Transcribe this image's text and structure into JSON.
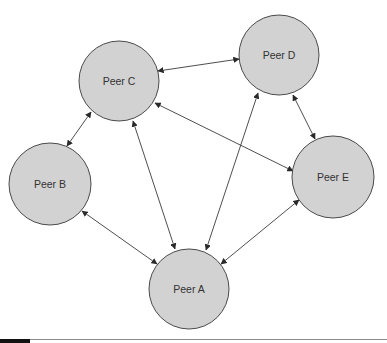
{
  "diagram": {
    "type": "peer-to-peer network",
    "colors": {
      "node_fill": "#d2d2d2",
      "node_stroke": "#4a4a4a",
      "edge": "#3a3a3a",
      "label": "#333333"
    },
    "nodes": [
      {
        "id": "A",
        "label": "Peer A",
        "cx": 189,
        "cy": 289,
        "r": 40
      },
      {
        "id": "B",
        "label": "Peer B",
        "cx": 50,
        "cy": 184,
        "r": 41
      },
      {
        "id": "C",
        "label": "Peer C",
        "cx": 119,
        "cy": 81,
        "r": 40
      },
      {
        "id": "D",
        "label": "Peer D",
        "cx": 279,
        "cy": 55,
        "r": 40
      },
      {
        "id": "E",
        "label": "Peer E",
        "cx": 333,
        "cy": 177,
        "r": 41
      }
    ],
    "edges": [
      {
        "from": "C",
        "to": "D",
        "x1": 158,
        "y1": 71,
        "x2": 239,
        "y2": 59,
        "bidirectional": true
      },
      {
        "from": "C",
        "to": "B",
        "x1": 91,
        "y1": 112,
        "x2": 67,
        "y2": 146,
        "bidirectional": true
      },
      {
        "from": "B",
        "to": "A",
        "x1": 82,
        "y1": 211,
        "x2": 157,
        "y2": 264,
        "bidirectional": true
      },
      {
        "from": "C",
        "to": "A",
        "x1": 133,
        "y1": 121,
        "x2": 175,
        "y2": 249,
        "bidirectional": true
      },
      {
        "from": "D",
        "to": "A",
        "x1": 258,
        "y1": 93,
        "x2": 206,
        "y2": 250,
        "bidirectional": true
      },
      {
        "from": "C",
        "to": "E",
        "x1": 155,
        "y1": 103,
        "x2": 293,
        "y2": 171,
        "bidirectional": true
      },
      {
        "from": "D",
        "to": "E",
        "x1": 293,
        "y1": 95,
        "x2": 315,
        "y2": 139,
        "bidirectional": true
      },
      {
        "from": "E",
        "to": "A",
        "x1": 299,
        "y1": 200,
        "x2": 221,
        "y2": 264,
        "bidirectional": true
      }
    ]
  }
}
